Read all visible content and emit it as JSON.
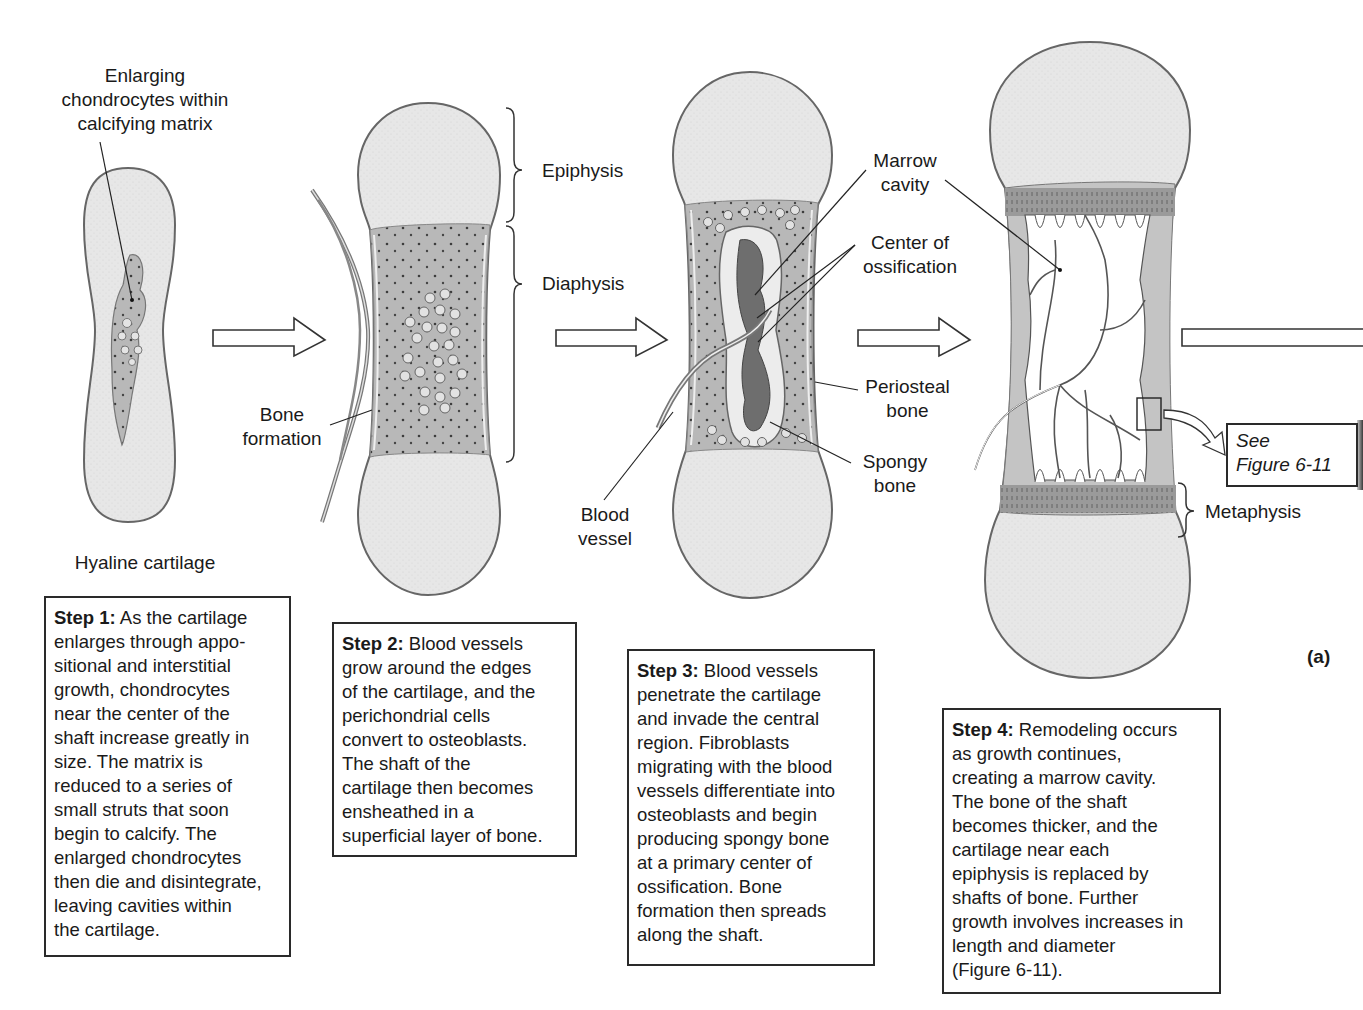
{
  "figure": {
    "panel_tag": "(a)",
    "colors": {
      "cartilage": "#e6e6e6",
      "bone_matrix": "#b9b9b9",
      "dark_tissue": "#7a7a7a",
      "outline": "#5a5a5a",
      "text": "#1a1a1a"
    }
  },
  "stage1": {
    "top_label": [
      "Enlarging",
      "chondrocytes within",
      "calcifying matrix"
    ],
    "bottom_label": "Hyaline cartilage",
    "step": {
      "title": "Step 1:",
      "text": " As the cartilage enlarges through appo-sitional and interstitial growth, chondrocytes near the center of the shaft increase greatly in size. The matrix is reduced to a series of small struts that soon begin to calcify. The enlarged chondrocytes then die and disintegrate, leaving cavities within the cartilage.",
      "lines": [
        "enlarges through appo-",
        "sitional and interstitial",
        "growth, chondrocytes",
        "near the center of the",
        "shaft increase greatly in",
        "size. The matrix is",
        "reduced to a series of",
        "small struts that soon",
        "begin to calcify. The",
        "enlarged chondrocytes",
        "then die and disintegrate,",
        "leaving cavities within",
        "the cartilage."
      ],
      "first_line": " As the cartilage"
    }
  },
  "stage2": {
    "labels": {
      "bone_formation": [
        "Bone",
        "formation"
      ],
      "epiphysis": "Epiphysis",
      "diaphysis": "Diaphysis"
    },
    "step": {
      "title": "Step 2:",
      "first_line": " Blood vessels",
      "lines": [
        "grow around the edges",
        "of the cartilage, and the",
        "perichondrial cells",
        "convert to osteoblasts.",
        "The shaft of the",
        "cartilage then becomes",
        "ensheathed in a",
        "superficial layer of bone."
      ]
    }
  },
  "stage3": {
    "labels": {
      "marrow_cavity": [
        "Marrow",
        "cavity"
      ],
      "center_of_ossification": [
        "Center of",
        "ossification"
      ],
      "periosteal_bone": [
        "Periosteal",
        "bone"
      ],
      "spongy_bone": [
        "Spongy",
        "bone"
      ],
      "blood_vessel": [
        "Blood",
        "vessel"
      ]
    },
    "step": {
      "title": "Step 3:",
      "first_line": " Blood vessels",
      "lines": [
        "penetrate the cartilage",
        "and invade the central",
        "region. Fibroblasts",
        "migrating with the blood",
        "vessels differentiate into",
        "osteoblasts and begin",
        "producing spongy bone",
        "at a primary center of",
        "ossification.  Bone",
        "formation then spreads",
        "along the shaft."
      ]
    }
  },
  "stage4": {
    "labels": {
      "metaphysis": "Metaphysis",
      "see_figure": [
        "See",
        "Figure 6-11"
      ]
    },
    "step": {
      "title": "Step 4:",
      "first_line": " Remodeling occurs",
      "lines": [
        "as growth continues,",
        "creating a marrow cavity.",
        "The bone of the shaft",
        "becomes thicker, and the",
        "cartilage near each",
        "epiphysis is replaced by",
        "shafts of bone. Further",
        "growth involves increases in",
        "length and diameter",
        "(Figure 6-11)."
      ]
    }
  }
}
